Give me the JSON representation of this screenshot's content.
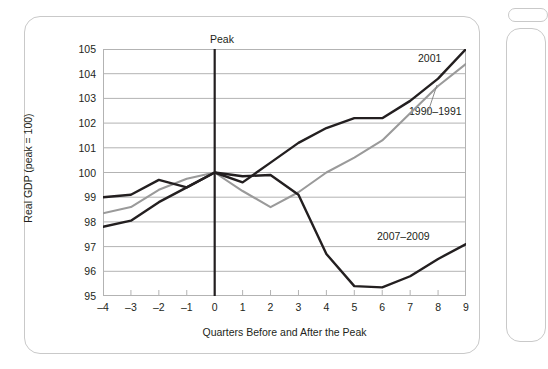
{
  "chart_data": {
    "type": "line",
    "title": "",
    "xlabel": "Quarters Before and After the Peak",
    "ylabel": "Real GDP (peak = 100)",
    "x": [
      -4,
      -3,
      -2,
      -1,
      0,
      1,
      2,
      3,
      4,
      5,
      6,
      7,
      8,
      9
    ],
    "xlim": [
      -4,
      9
    ],
    "ylim": [
      95,
      105
    ],
    "yticks": [
      95,
      96,
      97,
      98,
      99,
      100,
      101,
      102,
      103,
      104,
      105
    ],
    "xticks": [
      "–4",
      "–3",
      "–2",
      "–1",
      "0",
      "1",
      "2",
      "3",
      "4",
      "5",
      "6",
      "7",
      "8",
      "9"
    ],
    "grid": true,
    "legend_position": "inline-labels",
    "annotations": [
      {
        "text": "Peak",
        "x": 0,
        "note": "vertical reference line at quarter 0"
      }
    ],
    "series": [
      {
        "name": "2001",
        "color": "#231f20",
        "values": [
          99.0,
          99.1,
          99.7,
          99.4,
          100.0,
          99.6,
          100.4,
          101.2,
          101.8,
          102.2,
          102.2,
          102.9,
          103.8,
          105.0
        ]
      },
      {
        "name": "1990–1991",
        "color": "#9a9a9a",
        "values": [
          98.35,
          98.6,
          99.3,
          99.75,
          100.0,
          99.25,
          98.6,
          99.2,
          100.0,
          100.6,
          101.3,
          102.4,
          103.5,
          104.4
        ]
      },
      {
        "name": "2007–2009",
        "color": "#231f20",
        "values": [
          97.8,
          98.05,
          98.8,
          99.4,
          100.0,
          99.85,
          99.9,
          99.1,
          96.7,
          95.4,
          95.35,
          95.8,
          96.5,
          97.1
        ]
      }
    ]
  },
  "chart": {
    "peak_label": "Peak",
    "x_axis_title": "Quarters Before and After the Peak",
    "y_axis_title": "Real GDP (peak = 100)",
    "series_labels": {
      "s2001": "2001",
      "s1990": "1990–1991",
      "s2007": "2007–2009"
    },
    "yticks": {
      "t105": "105",
      "t104": "104",
      "t103": "103",
      "t102": "102",
      "t101": "101",
      "t100": "100",
      "t99": "99",
      "t98": "98",
      "t97": "97",
      "t96": "96",
      "t95": "95"
    },
    "xticks": {
      "m4": "–4",
      "m3": "–3",
      "m2": "–2",
      "m1": "–1",
      "p0": "0",
      "p1": "1",
      "p2": "2",
      "p3": "3",
      "p4": "4",
      "p5": "5",
      "p6": "6",
      "p7": "7",
      "p8": "8",
      "p9": "9"
    },
    "colors": {
      "dark_line": "#231f20",
      "gray_line": "#9a9a9a",
      "gridline": "#b3b3b3",
      "frame": "#c9c9c9",
      "background": "#ffffff"
    }
  }
}
